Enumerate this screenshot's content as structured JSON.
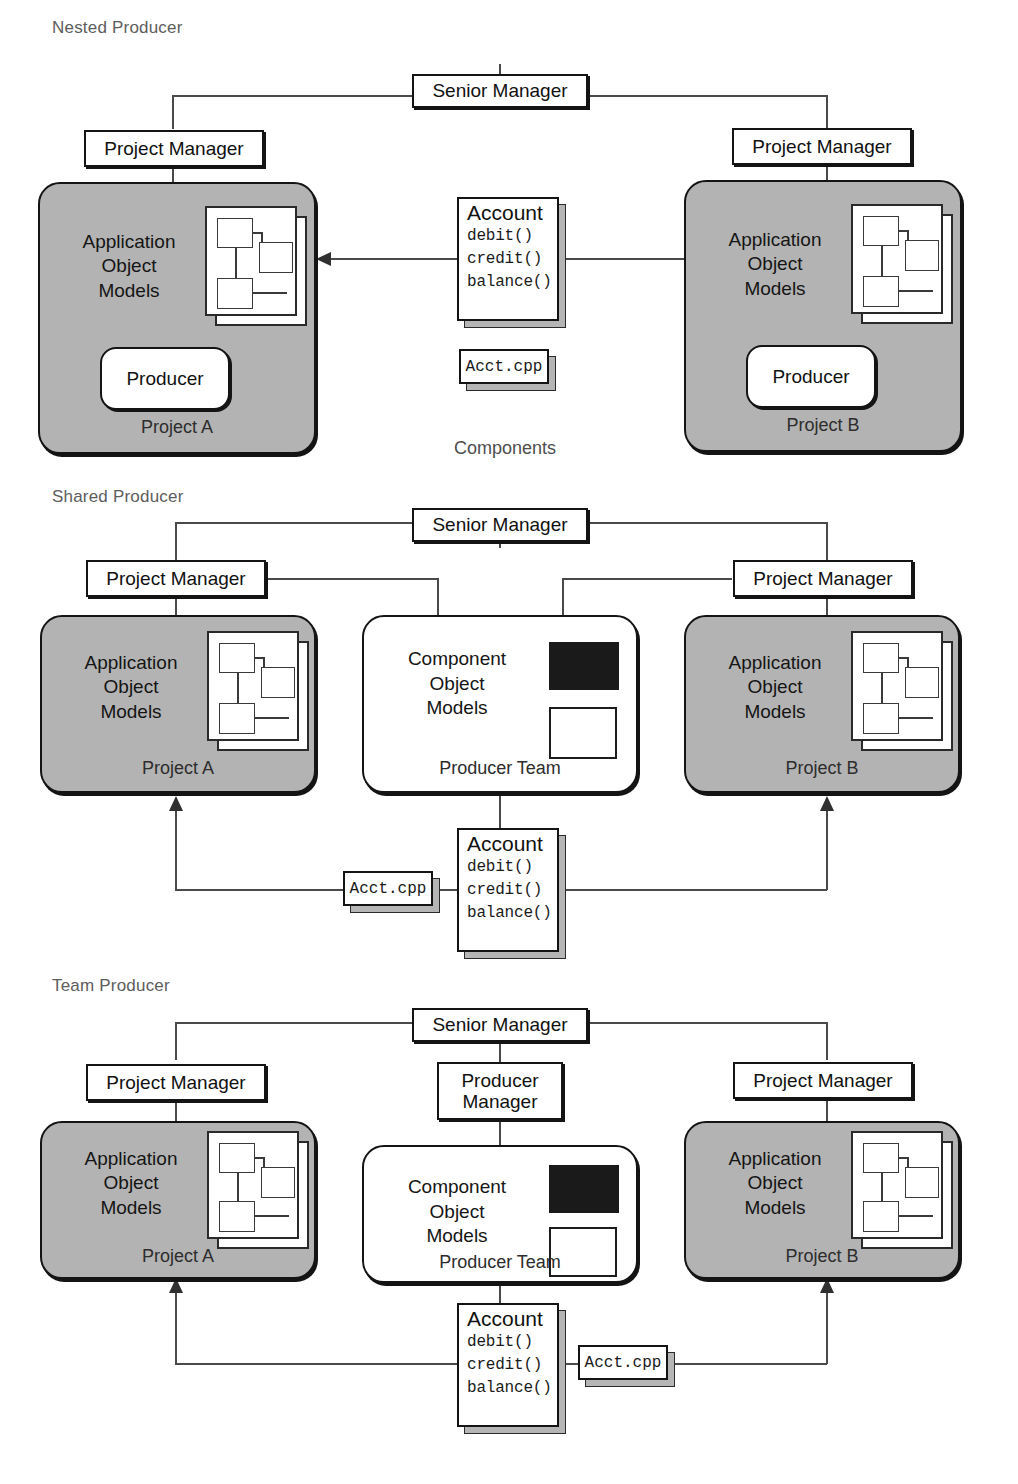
{
  "figure": {
    "caption_labels": [
      "Nested Producer",
      "Shared Producer",
      "Team Producer"
    ],
    "components_caption": "Components"
  },
  "colors": {
    "project_fill": "#b3b3b3",
    "team_fill": "#ffffff",
    "stroke": "#141414",
    "label_grey": "#5d5d5d",
    "swatch_dark": "#1a1a1a"
  },
  "common": {
    "senior_manager": "Senior Manager",
    "project_manager": "Project Manager",
    "producer_manager_line1": "Producer",
    "producer_manager_line2": "Manager",
    "producer": "Producer",
    "app_model_line1": "Application",
    "app_model_line2": "Object",
    "app_model_line3": "Models",
    "comp_model_line1": "Component",
    "comp_model_line2": "Object",
    "comp_model_line3": "Models",
    "project_a": "Project A",
    "project_b": "Project B",
    "producer_team": "Producer Team",
    "account_name": "Account",
    "account_ops": [
      "debit()",
      "credit()",
      "balance()"
    ],
    "source_file": "Acct.cpp"
  },
  "sections": [
    {
      "id": "nested-producer",
      "label": "Nested Producer",
      "senior_manager": "Senior Manager",
      "left_manager": "Project Manager",
      "right_manager": "Project Manager",
      "left_project": {
        "models": [
          "Application",
          "Object",
          "Models"
        ],
        "footer": "Project A",
        "has_producer_pill": true,
        "producer": "Producer"
      },
      "right_project": {
        "models": [
          "Application",
          "Object",
          "Models"
        ],
        "footer": "Project B",
        "has_producer_pill": true,
        "producer": "Producer"
      },
      "component": {
        "name": "Account",
        "ops": [
          "debit()",
          "credit()",
          "balance()"
        ]
      },
      "file": "Acct.cpp",
      "caption": "Components"
    },
    {
      "id": "shared-producer",
      "label": "Shared Producer",
      "senior_manager": "Senior Manager",
      "left_manager": "Project Manager",
      "right_manager": "Project Manager",
      "left_project": {
        "models": [
          "Application",
          "Object",
          "Models"
        ],
        "footer": "Project A",
        "has_producer_pill": false
      },
      "middle_team": {
        "models": [
          "Component",
          "Object",
          "Models"
        ],
        "footer": "Producer Team"
      },
      "right_project": {
        "models": [
          "Application",
          "Object",
          "Models"
        ],
        "footer": "Project B",
        "has_producer_pill": false
      },
      "component": {
        "name": "Account",
        "ops": [
          "debit()",
          "credit()",
          "balance()"
        ]
      },
      "file": "Acct.cpp",
      "file_side": "left"
    },
    {
      "id": "team-producer",
      "label": "Team Producer",
      "senior_manager": "Senior Manager",
      "left_manager": "Project Manager",
      "right_manager": "Project Manager",
      "producer_manager": [
        "Producer",
        "Manager"
      ],
      "left_project": {
        "models": [
          "Application",
          "Object",
          "Models"
        ],
        "footer": "Project A",
        "has_producer_pill": false
      },
      "middle_team": {
        "models": [
          "Component",
          "Object",
          "Models"
        ],
        "footer": "Producer Team"
      },
      "right_project": {
        "models": [
          "Application",
          "Object",
          "Models"
        ],
        "footer": "Project B",
        "has_producer_pill": false
      },
      "component": {
        "name": "Account",
        "ops": [
          "debit()",
          "credit()",
          "balance()"
        ]
      },
      "file": "Acct.cpp",
      "file_side": "right"
    }
  ]
}
